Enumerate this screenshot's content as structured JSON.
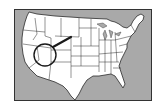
{
  "map": {
    "subject": "Contiguous United States",
    "colors": {
      "ocean": "#a9a9a9",
      "land": "#ffffff",
      "border": "#2a2a2a",
      "annotation": "#1a1a1a"
    },
    "annotation": {
      "type": "circle-with-arrow",
      "highlighted_region": "Four Corners region (Utah / Colorado / Arizona / New Mexico)"
    }
  }
}
